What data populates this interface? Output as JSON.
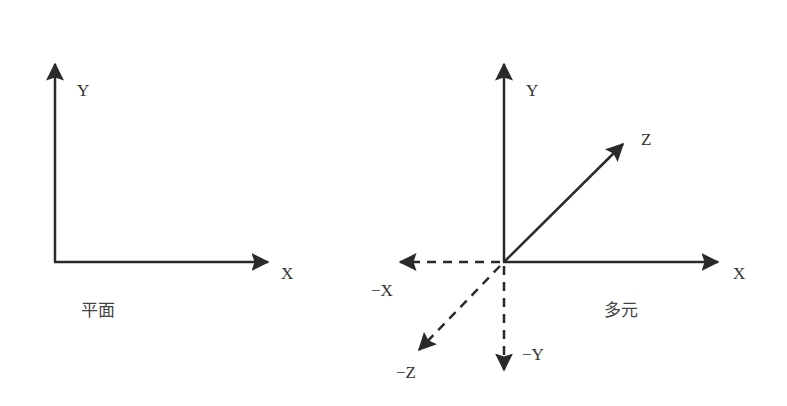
{
  "colors": {
    "stroke": "#2a2a2a",
    "text": "#333333",
    "background": "#ffffff"
  },
  "left_diagram": {
    "caption": "平面",
    "axes": {
      "y_label": "Y",
      "x_label": "X"
    }
  },
  "right_diagram": {
    "caption": "多元",
    "axes": {
      "y_label": "Y",
      "x_label": "X",
      "z_label": "Z",
      "neg_x_label": "−X",
      "neg_y_label": "−Y",
      "neg_z_label": "−Z"
    }
  }
}
